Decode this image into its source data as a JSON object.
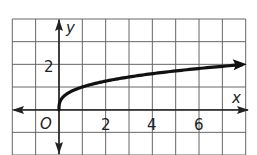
{
  "chart_data": {
    "type": "line",
    "title": "",
    "xlabel": "x",
    "ylabel": "y",
    "origin_label": "O",
    "xlim": [
      -2,
      8
    ],
    "ylim": [
      -2,
      4
    ],
    "grid": true,
    "x_ticks": [
      "2",
      "4",
      "6"
    ],
    "y_ticks": [
      "2"
    ],
    "series": [
      {
        "name": "y = cube root of x",
        "x": [
          0,
          0.125,
          1,
          2,
          4,
          6,
          8
        ],
        "y": [
          0,
          0.5,
          1,
          1.26,
          1.59,
          1.82,
          2
        ],
        "arrow_end": true
      }
    ],
    "legend": null
  },
  "labels": {
    "x_axis": "x",
    "y_axis": "y",
    "origin": "O",
    "tick_x2": "2",
    "tick_x4": "4",
    "tick_x6": "6",
    "tick_y2": "2"
  },
  "colors": {
    "grid": "#555555",
    "axis": "#222222",
    "curve": "#111111"
  }
}
